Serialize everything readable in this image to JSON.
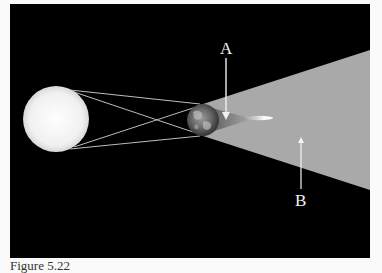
{
  "figure": {
    "labels": {
      "a": "A",
      "b": "B"
    },
    "caption": "Figure 5.22"
  },
  "objects": {
    "sun": {
      "name": "Sun",
      "cx": 56,
      "cy": 119,
      "r": 33,
      "color": "#f4f4f4"
    },
    "earth": {
      "name": "Earth",
      "cx": 203,
      "cy": 120,
      "r": 16
    },
    "moon": {
      "name": "Moon (streak in shadow)",
      "x1": 245,
      "x2": 272,
      "y": 118
    }
  },
  "shadow": {
    "penumbra_color": "#a9a9a9",
    "umbra_color": "#6e6e6e",
    "background_color": "#000000"
  },
  "arrows": {
    "a": {
      "points_to": "umbra",
      "x": 226,
      "y_start": 57,
      "y_end": 119
    },
    "b": {
      "points_to": "penumbra",
      "x": 301,
      "y_start": 190,
      "y_end": 137
    }
  }
}
